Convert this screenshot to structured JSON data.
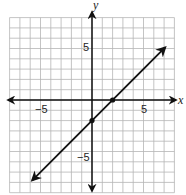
{
  "chart_data": {
    "type": "line",
    "title": "",
    "xlabel": "x",
    "ylabel": "y",
    "xlim": [
      -8,
      8
    ],
    "ylim": [
      -9,
      8
    ],
    "grid": true,
    "x_ticks": [
      {
        "value": -5,
        "label": "−5"
      },
      {
        "value": 5,
        "label": "5"
      }
    ],
    "y_ticks": [
      {
        "value": 5,
        "label": "5"
      },
      {
        "value": -5,
        "label": "−5"
      }
    ],
    "series": [
      {
        "name": "y = x - 2",
        "equation": "y = x - 2",
        "slope": 1,
        "intercept": -2,
        "x": [
          -5.8,
          7.1
        ],
        "y": [
          -7.8,
          5.1
        ],
        "arrows": "both",
        "points": [
          {
            "x": 0,
            "y": -2
          },
          {
            "x": 2,
            "y": 0
          }
        ]
      }
    ],
    "colors": {
      "grid": "#b5b5b5",
      "axis": "#111111",
      "line": "#111111"
    }
  },
  "labels": {
    "x_axis": "x",
    "y_axis": "y",
    "x_tick_neg5": "−5",
    "x_tick_5": "5",
    "y_tick_5": "5",
    "y_tick_neg5": "−5"
  }
}
